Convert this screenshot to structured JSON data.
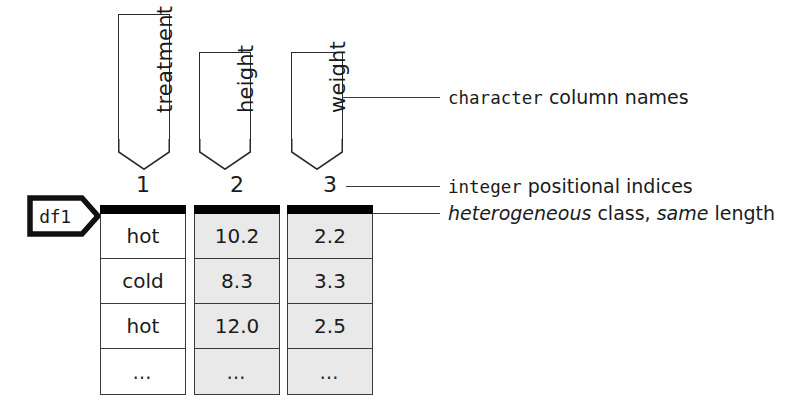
{
  "figure": {
    "kind": "data-frame-anatomy-diagram",
    "object_tag": "df1"
  },
  "column_banners": [
    {
      "name": "treatment"
    },
    {
      "name": "height"
    },
    {
      "name": "weight"
    }
  ],
  "positional_indices": [
    "1",
    "2",
    "3"
  ],
  "table": {
    "columns": [
      {
        "index": "1",
        "name": "treatment",
        "fill": "white",
        "cells": [
          "hot",
          "cold",
          "hot",
          "…"
        ]
      },
      {
        "index": "2",
        "name": "height",
        "fill": "gray",
        "cells": [
          "10.2",
          "8.3",
          "12.0",
          "…"
        ]
      },
      {
        "index": "3",
        "name": "weight",
        "fill": "gray",
        "cells": [
          "2.2",
          "3.3",
          "2.5",
          "…"
        ]
      }
    ]
  },
  "annotations": {
    "column_names": {
      "emphasis": "character",
      "rest": "column names"
    },
    "indices": {
      "emphasis": "integer",
      "rest": "positional indices"
    },
    "class_length": {
      "italic_1": "heterogeneous",
      "mid": "class,",
      "italic_2": "same",
      "tail": "length"
    }
  },
  "colors": {
    "ink": "#1b1b1b",
    "rule": "#3a3a3a",
    "header_bar": "#000000",
    "gray_fill": "#e9e9e9",
    "white_fill": "#ffffff"
  }
}
